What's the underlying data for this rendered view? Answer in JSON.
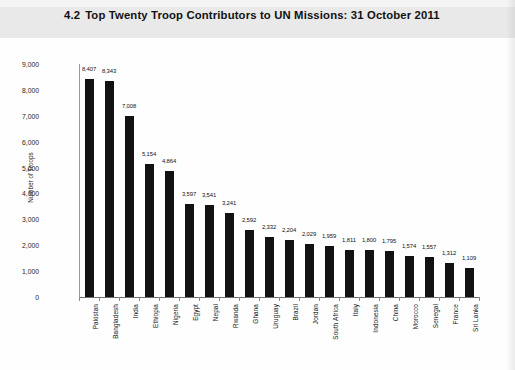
{
  "header": {
    "section_number": "4.2",
    "title": "Top Twenty Troop Contributors to UN Missions: 31 October 2011"
  },
  "chart_data": {
    "type": "bar",
    "xlabel": "",
    "ylabel": "Number of Troops",
    "ylim": [
      0,
      9000
    ],
    "ytick_step": 1000,
    "ytick_labels": [
      "0",
      "1,000",
      "2,000",
      "3,000",
      "4,000",
      "5,000",
      "6,000",
      "7,000",
      "8,000",
      "9,000"
    ],
    "grid": false,
    "legend": false,
    "bar_color": "#121212",
    "data_labels": true,
    "categories": [
      "Pakistan",
      "Bangladesh",
      "India",
      "Ethiopia",
      "Nigeria",
      "Egypt",
      "Nepal",
      "Rwanda",
      "Ghana",
      "Uruguay",
      "Brazil",
      "Jordan",
      "South Africa",
      "Italy",
      "Indonesia",
      "China",
      "Morocco",
      "Senegal",
      "France",
      "Sri Lanka"
    ],
    "values": [
      8407,
      8343,
      7008,
      5154,
      4864,
      3597,
      3541,
      3241,
      2592,
      2332,
      2204,
      2029,
      1959,
      1811,
      1800,
      1795,
      1574,
      1557,
      1312,
      1109
    ],
    "value_labels": [
      "8,407",
      "8,343",
      "7,008",
      "5,154",
      "4,864",
      "3,597",
      "3,541",
      "3,241",
      "2,592",
      "2,332",
      "2,204",
      "2,029",
      "1,959",
      "1,811",
      "1,800",
      "1,795",
      "1,574",
      "1,557",
      "1,312",
      "1,109"
    ]
  }
}
